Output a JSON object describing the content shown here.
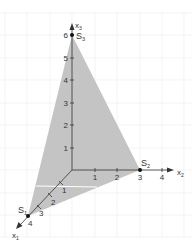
{
  "diagram": {
    "type": "3d-coordinate-system",
    "axes": {
      "x1": {
        "label": "x",
        "sub": "1",
        "ticks": [
          "1",
          "2",
          "3",
          "4"
        ]
      },
      "x2": {
        "label": "x",
        "sub": "2",
        "ticks": [
          "1",
          "2",
          "3",
          "4"
        ]
      },
      "x3": {
        "label": "x",
        "sub": "3",
        "ticks": [
          "1",
          "2",
          "3",
          "4",
          "5",
          "6"
        ]
      }
    },
    "points": [
      {
        "name": "S",
        "sub": "1",
        "coords": [
          4,
          0,
          0
        ]
      },
      {
        "name": "S",
        "sub": "2",
        "coords": [
          0,
          3,
          0
        ]
      },
      {
        "name": "S",
        "sub": "3",
        "coords": [
          0,
          0,
          6
        ]
      }
    ],
    "plane": {
      "vertices": [
        "S1",
        "S2",
        "S3"
      ],
      "fill": "#c4c4c4"
    },
    "colors": {
      "axis": "#333333",
      "grid": "#e6e6e6",
      "plane": "#c4c4c4",
      "point": "#111111"
    }
  }
}
